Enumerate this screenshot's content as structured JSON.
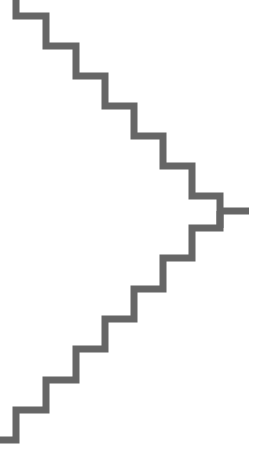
{
  "diagram": {
    "type": "staircase-chevron",
    "stroke_color": "#666666",
    "background": "#ffffff",
    "stroke_width": 7,
    "top_branch_points": "16,0 16,16 46,16 46,46 76,46 76,76 105,76 105,106 134,106 134,136 163,136 163,166 192,166 192,196 220,196 220,228",
    "tip_points": "220,211 249,211",
    "bottom_branch_points": "220,211 220,228 192,228 192,258 163,258 163,289 134,289 134,319 105,319 105,349 76,349 76,380 46,380 46,410 16,410 16,440 0,440"
  }
}
